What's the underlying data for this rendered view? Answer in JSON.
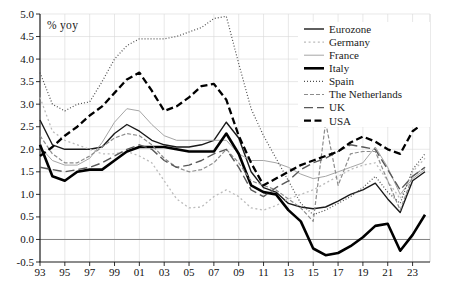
{
  "figure": {
    "axis_unit_label": "% yoy"
  },
  "chart_data": {
    "type": "line",
    "title": "",
    "xlabel": "",
    "ylabel": "% yoy",
    "grid": true,
    "legend_position": "upper right",
    "ylim": [
      -0.5,
      5.0
    ],
    "y_tick_values": [
      5.0,
      4.5,
      4.0,
      3.5,
      3.0,
      2.5,
      2.0,
      1.5,
      1.0,
      0.5,
      0.0,
      -0.5
    ],
    "y_tick_labels": [
      "5.0",
      "4.5",
      "4.0",
      "3.5",
      "3.0",
      "2.5",
      "2.0",
      "1.5",
      "1.0",
      "0.5",
      "0.0",
      "-0.5"
    ],
    "x_tick_years": [
      1993,
      1995,
      1997,
      1999,
      2001,
      2003,
      2005,
      2007,
      2009,
      2011,
      2013,
      2015,
      2017,
      2019,
      2021,
      2023
    ],
    "x_tick_labels": [
      "93",
      "95",
      "97",
      "99",
      "01",
      "03",
      "05",
      "07",
      "09",
      "11",
      "13",
      "15",
      "17",
      "19",
      "21",
      "23"
    ],
    "x": [
      1993,
      1994,
      1995,
      1996,
      1997,
      1998,
      1999,
      2000,
      2001,
      2002,
      2003,
      2004,
      2005,
      2006,
      2007,
      2008,
      2009,
      2010,
      2011,
      2012,
      2013,
      2014,
      2015,
      2016,
      2017,
      2018,
      2019,
      2020,
      2021,
      2022,
      2023,
      2024
    ],
    "series": [
      {
        "name": "Eurozone",
        "color": "#1a1a1a",
        "width": 1.4,
        "dash": "",
        "values": [
          2.65,
          2.1,
          2.0,
          2.0,
          2.0,
          2.05,
          2.35,
          2.55,
          2.4,
          2.2,
          2.1,
          2.05,
          2.05,
          2.1,
          2.2,
          2.6,
          2.25,
          1.5,
          1.15,
          1.05,
          0.8,
          0.72,
          0.68,
          0.72,
          0.85,
          1.0,
          1.1,
          1.25,
          0.9,
          0.6,
          1.3,
          1.5
        ]
      },
      {
        "name": "Germany",
        "color": "#bbbbbb",
        "width": 1.3,
        "dash": "2,2.6",
        "values": [
          3.15,
          2.4,
          2.2,
          2.1,
          2.0,
          1.9,
          1.9,
          1.95,
          1.85,
          1.7,
          1.3,
          0.9,
          0.7,
          0.72,
          0.95,
          1.1,
          0.95,
          0.7,
          0.65,
          0.75,
          0.9,
          1.0,
          1.1,
          1.25,
          1.4,
          1.55,
          1.65,
          1.7,
          1.3,
          0.9,
          1.5,
          1.8
        ]
      },
      {
        "name": "France",
        "color": "#a6a6a6",
        "width": 1.0,
        "dash": "",
        "values": [
          2.05,
          1.75,
          1.65,
          1.65,
          1.8,
          2.15,
          2.6,
          2.9,
          2.85,
          2.55,
          2.3,
          2.2,
          2.2,
          2.2,
          2.2,
          2.2,
          1.9,
          1.75,
          1.75,
          1.7,
          1.6,
          1.45,
          1.35,
          1.4,
          1.5,
          1.6,
          1.7,
          2.05,
          1.6,
          1.0,
          1.35,
          1.55
        ]
      },
      {
        "name": "Italy",
        "color": "#000000",
        "width": 2.6,
        "dash": "",
        "values": [
          2.1,
          1.4,
          1.3,
          1.5,
          1.55,
          1.55,
          1.75,
          1.95,
          2.05,
          2.05,
          2.05,
          2.0,
          1.95,
          1.95,
          1.95,
          2.35,
          1.9,
          1.2,
          1.05,
          1.0,
          0.65,
          0.4,
          -0.2,
          -0.35,
          -0.3,
          -0.15,
          0.05,
          0.3,
          0.35,
          -0.25,
          0.1,
          0.55
        ]
      },
      {
        "name": "Spain",
        "color": "#4d4d4d",
        "width": 1.2,
        "dash": "1,2",
        "values": [
          3.7,
          3.0,
          2.85,
          3.0,
          3.05,
          3.5,
          4.0,
          4.3,
          4.45,
          4.45,
          4.45,
          4.5,
          4.6,
          4.7,
          4.9,
          4.95,
          3.9,
          2.9,
          2.3,
          1.8,
          1.3,
          0.8,
          0.55,
          0.65,
          0.8,
          0.95,
          1.15,
          1.4,
          1.05,
          0.8,
          1.55,
          1.9
        ]
      },
      {
        "name": "The Netherlands",
        "color": "#8c8c8c",
        "width": 1.2,
        "dash": "4,2",
        "values": [
          2.3,
          1.9,
          1.7,
          1.7,
          1.85,
          2.05,
          2.25,
          2.35,
          2.3,
          2.1,
          1.8,
          1.6,
          1.5,
          1.55,
          1.7,
          2.0,
          1.7,
          1.3,
          1.2,
          1.1,
          0.9,
          0.7,
          0.4,
          2.6,
          1.2,
          1.9,
          1.95,
          1.95,
          1.3,
          0.65,
          1.4,
          1.6
        ]
      },
      {
        "name": "UK",
        "color": "#595959",
        "width": 1.4,
        "dash": "9,4",
        "values": [
          1.6,
          1.55,
          1.5,
          1.55,
          1.6,
          1.7,
          1.85,
          2.0,
          2.1,
          2.0,
          1.75,
          1.6,
          1.65,
          1.75,
          1.9,
          2.0,
          1.6,
          1.1,
          0.95,
          1.15,
          1.3,
          1.55,
          1.7,
          1.8,
          1.95,
          2.1,
          2.05,
          2.0,
          1.55,
          1.1,
          1.4,
          1.6
        ]
      },
      {
        "name": "USA",
        "color": "#000000",
        "width": 2.3,
        "dash": "7,3.5",
        "values": [
          1.85,
          2.05,
          2.3,
          2.5,
          2.75,
          2.95,
          3.25,
          3.55,
          3.7,
          3.3,
          2.85,
          2.95,
          3.15,
          3.4,
          3.45,
          3.1,
          2.3,
          1.7,
          1.2,
          1.35,
          1.5,
          1.65,
          1.75,
          1.85,
          1.95,
          2.15,
          2.28,
          2.17,
          2.0,
          1.9,
          2.4,
          2.6
        ]
      }
    ]
  }
}
